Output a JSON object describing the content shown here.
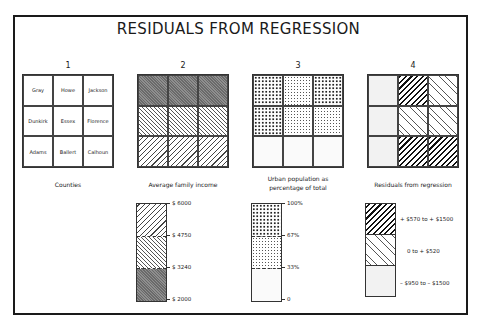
{
  "title": "RESIDUALS FROM REGRESSION",
  "maps": [
    {
      "number": "1",
      "caption": "Counties",
      "cells": [
        {
          "label": "Gray",
          "pattern": "empty"
        },
        {
          "label": "Howe",
          "pattern": "empty"
        },
        {
          "label": "Jackson",
          "pattern": "empty"
        },
        {
          "label": "Dunkirk",
          "pattern": "empty"
        },
        {
          "label": "Essex",
          "pattern": "empty"
        },
        {
          "label": "Florence",
          "pattern": "empty"
        },
        {
          "label": "Adams",
          "pattern": "empty"
        },
        {
          "label": "Ballert",
          "pattern": "empty"
        },
        {
          "label": "Calhoun",
          "pattern": "empty"
        }
      ]
    },
    {
      "number": "2",
      "caption": "Average family income",
      "cells": [
        {
          "pattern": "dark"
        },
        {
          "pattern": "dark"
        },
        {
          "pattern": "dark"
        },
        {
          "pattern": "back"
        },
        {
          "pattern": "back"
        },
        {
          "pattern": "back"
        },
        {
          "pattern": "fwd"
        },
        {
          "pattern": "fwd"
        },
        {
          "pattern": "fwd"
        }
      ]
    },
    {
      "number": "3",
      "caption_line1": "Urban population as",
      "caption_line2": "percentage of total",
      "cells": [
        {
          "pattern": "dense"
        },
        {
          "pattern": "medium"
        },
        {
          "pattern": "dense"
        },
        {
          "pattern": "dense"
        },
        {
          "pattern": "medium"
        },
        {
          "pattern": "medium"
        },
        {
          "pattern": "light"
        },
        {
          "pattern": "light"
        },
        {
          "pattern": "light"
        }
      ]
    },
    {
      "number": "4",
      "caption": "Residuals from regression",
      "cells": [
        {
          "pattern": "grid"
        },
        {
          "pattern": "heavy"
        },
        {
          "pattern": "lightback"
        },
        {
          "pattern": "grid"
        },
        {
          "pattern": "lightback"
        },
        {
          "pattern": "lightback"
        },
        {
          "pattern": "grid"
        },
        {
          "pattern": "heavy"
        },
        {
          "pattern": "heavy"
        }
      ]
    }
  ],
  "legends": {
    "income": {
      "segments": [
        "fwd",
        "back",
        "dark"
      ],
      "ticks": [
        "$ 6000",
        "$ 4750",
        "$ 3240",
        "$ 2000"
      ]
    },
    "urban": {
      "segments": [
        "dense",
        "medium",
        "light"
      ],
      "ticks": [
        "100%",
        "67%",
        "33%",
        "0"
      ]
    },
    "residuals": {
      "segments": [
        "heavy",
        "lightback",
        "grid"
      ],
      "ranges": [
        "+ $570 to + $1500",
        "0 to + $520",
        "– $950 to – $1500"
      ]
    }
  }
}
